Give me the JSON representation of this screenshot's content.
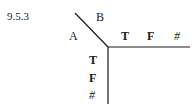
{
  "section_number": "9.5.3",
  "table_header": {
    "row_variable": "A",
    "column_variable": "B",
    "column_values": [
      "T",
      "F",
      "#"
    ],
    "row_values": [
      "T",
      "F",
      "#"
    ]
  }
}
